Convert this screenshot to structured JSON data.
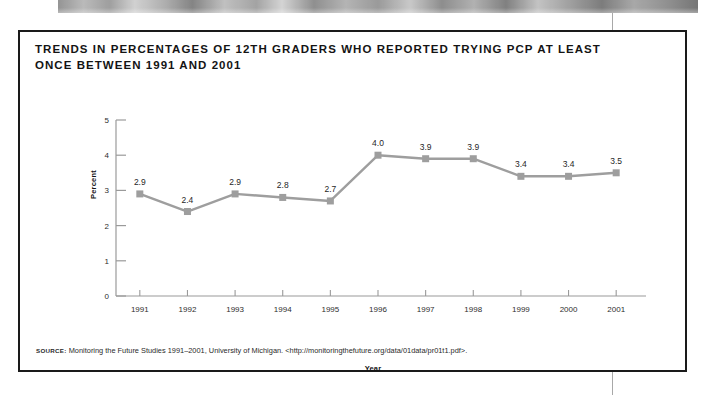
{
  "figure": {
    "title": "TRENDS IN PERCENTAGES OF 12TH GRADERS WHO REPORTED TRYING PCP AT LEAST ONCE BETWEEN 1991 AND 2001",
    "source_label": "Source:",
    "source_text": "Monitoring the Future Studies 1991–2001, University of Michigan. <http://monitoringthefuture.org/data/01data/pr01t1.pdf>."
  },
  "colors": {
    "box_border": "#1a1a1a",
    "series_line": "#9e9e9e",
    "marker": "#9e9e9e",
    "axis": "#9a9a9a",
    "text": "#141414",
    "page_background": "#ffffff"
  },
  "chart_data": {
    "type": "line",
    "title": "TRENDS IN PERCENTAGES OF 12TH GRADERS WHO REPORTED TRYING PCP AT LEAST ONCE BETWEEN 1991 AND 2001",
    "xlabel": "Year",
    "ylabel": "Percent",
    "categories": [
      "1991",
      "1992",
      "1993",
      "1994",
      "1995",
      "1996",
      "1997",
      "1998",
      "1999",
      "2000",
      "2001"
    ],
    "values": [
      2.9,
      2.4,
      2.9,
      2.8,
      2.7,
      4.0,
      3.9,
      3.9,
      3.4,
      3.4,
      3.5
    ],
    "data_labels": [
      "2.9",
      "2.4",
      "2.9",
      "2.8",
      "2.7",
      "4.0",
      "3.9",
      "3.9",
      "3.4",
      "3.4",
      "3.5"
    ],
    "ylim": [
      0,
      5
    ],
    "yticks": [
      0,
      1,
      2,
      3,
      4,
      5
    ],
    "ytick_labels": [
      "0",
      "1",
      "2",
      "3",
      "4",
      "5"
    ],
    "grid": false,
    "legend": false,
    "marker": "square",
    "series": [
      {
        "name": "12th graders trying PCP at least once",
        "values": [
          2.9,
          2.4,
          2.9,
          2.8,
          2.7,
          4.0,
          3.9,
          3.9,
          3.4,
          3.4,
          3.5
        ]
      }
    ]
  }
}
